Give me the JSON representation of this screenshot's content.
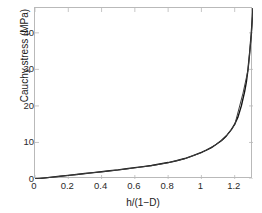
{
  "chart_data": {
    "type": "line",
    "title": "",
    "xlabel": "h/(1−D)",
    "ylabel": "Cauchy stress (MPa)",
    "xlim": [
      0,
      1.31
    ],
    "ylim": [
      0,
      46.8
    ],
    "xticks": [
      "0",
      "0.2",
      "0.4",
      "0.6",
      "0.8",
      "1",
      "1.2"
    ],
    "xtick_values": [
      0,
      0.2,
      0.4,
      0.6,
      0.8,
      1,
      1.2
    ],
    "yticks": [
      "0",
      "10",
      "20",
      "30",
      "40"
    ],
    "ytick_values": [
      0,
      10,
      20,
      30,
      40
    ],
    "grid": false,
    "legend": null,
    "series": [
      {
        "name": "Cauchy stress",
        "color": "#111111",
        "x": [
          0,
          0.05,
          0.1,
          0.15,
          0.2,
          0.25,
          0.3,
          0.35,
          0.4,
          0.45,
          0.5,
          0.55,
          0.6,
          0.65,
          0.7,
          0.75,
          0.8,
          0.85,
          0.9,
          0.95,
          1.0,
          1.03,
          1.06,
          1.09,
          1.12,
          1.15,
          1.18,
          1.2,
          1.22,
          1.24,
          1.26,
          1.27,
          1.28,
          1.29,
          1.3,
          1.31
        ],
        "values": [
          0,
          0.25,
          0.5,
          0.75,
          1.0,
          1.25,
          1.5,
          1.75,
          2.0,
          2.25,
          2.5,
          2.8,
          3.1,
          3.4,
          3.7,
          4.1,
          4.5,
          5.0,
          5.6,
          6.4,
          7.3,
          7.9,
          8.6,
          9.5,
          10.5,
          11.8,
          13.5,
          15.0,
          17.0,
          20.0,
          24.0,
          26.5,
          30.0,
          34.5,
          40.0,
          46.8
        ]
      },
      {
        "name": "Cauchy stress overlay",
        "color": "#3d3d3d",
        "x": [
          0,
          0.1,
          0.2,
          0.3,
          0.4,
          0.5,
          0.6,
          0.7,
          0.8,
          0.9,
          1.0,
          1.08,
          1.14,
          1.2,
          1.25,
          1.28,
          1.3,
          1.31
        ],
        "values": [
          0,
          0.48,
          0.98,
          1.48,
          1.98,
          2.48,
          3.05,
          3.65,
          4.45,
          5.55,
          7.2,
          9.2,
          11.2,
          14.8,
          23.5,
          29.8,
          39.5,
          46.5
        ]
      }
    ]
  },
  "axes": {
    "frame_color": "#b9b9b9",
    "tick_color": "#2a2a2a"
  }
}
